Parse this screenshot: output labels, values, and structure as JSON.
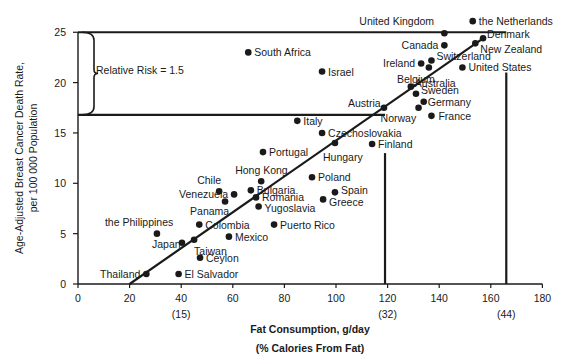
{
  "chart_data": {
    "type": "scatter",
    "title": "",
    "xlabel": "Fat Consumption, g/day",
    "xlabel_sub": "(% Calories From Fat)",
    "ylabel": "Age-Adjusted Breast Cancer Death Rate,",
    "ylabel_sub": "per 100 000 Population",
    "xlim": [
      0,
      180
    ],
    "ylim": [
      0,
      25
    ],
    "x_ticks": [
      0,
      20,
      40,
      60,
      80,
      100,
      120,
      140,
      160,
      180
    ],
    "y_ticks": [
      0,
      5,
      10,
      15,
      20,
      25
    ],
    "x_tick_annotations": [
      {
        "x": 40,
        "label": "(15)"
      },
      {
        "x": 120,
        "label": "(32)"
      },
      {
        "x": 166,
        "label": "(44)"
      }
    ],
    "grid": false,
    "legend": null,
    "annotation": {
      "label": "Relative Risk = 1.5",
      "upper_y": 25,
      "lower_y": 16.8,
      "brace_range": [
        16.8,
        25
      ]
    },
    "reference_lines": [
      {
        "type": "hline",
        "y": 25,
        "x_from": 0,
        "x_to": 166
      },
      {
        "type": "hline",
        "y": 16.8,
        "x_from": 0,
        "x_to": 119
      },
      {
        "type": "vline",
        "x": 119,
        "y_from": 0,
        "y_to": 13
      },
      {
        "type": "vline",
        "x": 166,
        "y_from": 0,
        "y_to": 21
      }
    ],
    "regression_line": {
      "x0": 20,
      "y0": 0,
      "x1": 157,
      "y1": 24.4
    },
    "points": [
      {
        "name": "Thailand",
        "x": 26.5,
        "y": 1.0,
        "lx": -48,
        "ly": 0
      },
      {
        "name": "El Salvador",
        "x": 39,
        "y": 1.0,
        "lx": 6,
        "ly": 0
      },
      {
        "name": "Ceylon",
        "x": 47.3,
        "y": 2.6,
        "lx": 6,
        "ly": 0
      },
      {
        "name": "the Philippines",
        "x": 30.6,
        "y": 5.0,
        "lx": -52,
        "ly": -12
      },
      {
        "name": "Japan",
        "x": 40.3,
        "y": 4.1,
        "lx": -30,
        "ly": 1
      },
      {
        "name": "Taiwan",
        "x": 45,
        "y": 4.4,
        "lx": 0,
        "ly": 11
      },
      {
        "name": "Colombia",
        "x": 47,
        "y": 5.9,
        "lx": 6,
        "ly": 0
      },
      {
        "name": "Mexico",
        "x": 58.5,
        "y": 4.7,
        "lx": 6,
        "ly": 0
      },
      {
        "name": "Puerto Rico",
        "x": 76,
        "y": 5.9,
        "lx": 6,
        "ly": 0
      },
      {
        "name": "Panama",
        "x": 57,
        "y": 8.2,
        "lx": -35,
        "ly": 10
      },
      {
        "name": "Venezuela",
        "x": 60.5,
        "y": 8.9,
        "lx": -68,
        "ly": 0
      },
      {
        "name": "Chile",
        "x": 54.7,
        "y": 9.2,
        "lx": -22,
        "ly": -11
      },
      {
        "name": "Bulgaria",
        "x": 67,
        "y": 9.3,
        "lx": 6,
        "ly": 0
      },
      {
        "name": "Romania",
        "x": 69,
        "y": 8.6,
        "lx": 6,
        "ly": 0
      },
      {
        "name": "Yugoslavia",
        "x": 70,
        "y": 7.7,
        "lx": 6,
        "ly": 2
      },
      {
        "name": "Hong Kong",
        "x": 71,
        "y": 10.2,
        "lx": -26,
        "ly": -11
      },
      {
        "name": "Portugal",
        "x": 71.7,
        "y": 13.1,
        "lx": 6,
        "ly": 0
      },
      {
        "name": "Poland",
        "x": 90.7,
        "y": 10.6,
        "lx": 6,
        "ly": 0
      },
      {
        "name": "Spain",
        "x": 99.6,
        "y": 9.1,
        "lx": 6,
        "ly": -2
      },
      {
        "name": "Greece",
        "x": 95,
        "y": 8.4,
        "lx": 6,
        "ly": 3
      },
      {
        "name": "Italy",
        "x": 85,
        "y": 16.2,
        "lx": 6,
        "ly": 0
      },
      {
        "name": "Czechoslovakia",
        "x": 94.6,
        "y": 15.0,
        "lx": 6,
        "ly": 0
      },
      {
        "name": "Hungary",
        "x": 99.6,
        "y": 14.0,
        "lx": -12,
        "ly": 14
      },
      {
        "name": "Finland",
        "x": 114,
        "y": 13.9,
        "lx": 6,
        "ly": 0
      },
      {
        "name": "Austria",
        "x": 118.6,
        "y": 17.5,
        "lx": -36,
        "ly": -5
      },
      {
        "name": "Israel",
        "x": 94.6,
        "y": 21.1,
        "lx": 6,
        "ly": 0
      },
      {
        "name": "South Africa",
        "x": 66,
        "y": 23.0,
        "lx": 6,
        "ly": 0
      },
      {
        "name": "Norway",
        "x": 132,
        "y": 17.5,
        "lx": -38,
        "ly": 10
      },
      {
        "name": "France",
        "x": 137,
        "y": 16.7,
        "lx": 7,
        "ly": 0
      },
      {
        "name": "Germany",
        "x": 134,
        "y": 18.1,
        "lx": 4,
        "ly": 0
      },
      {
        "name": "Sweden",
        "x": 131,
        "y": 18.9,
        "lx": 5,
        "ly": -4
      },
      {
        "name": "Australia",
        "x": 129,
        "y": 19.6,
        "lx": 4,
        "ly": -4
      },
      {
        "name": "Belgium",
        "x": 136,
        "y": 21.5,
        "lx": -32,
        "ly": 12
      },
      {
        "name": "Ireland",
        "x": 133,
        "y": 21.9,
        "lx": -36,
        "ly": 0
      },
      {
        "name": "Switzerland",
        "x": 137,
        "y": 22.2,
        "lx": 5,
        "ly": -4
      },
      {
        "name": "United States",
        "x": 149,
        "y": 21.5,
        "lx": 6,
        "ly": 0
      },
      {
        "name": "Canada",
        "x": 142,
        "y": 23.7,
        "lx": -40,
        "ly": 0
      },
      {
        "name": "United Kingdom",
        "x": 142,
        "y": 24.9,
        "lx": -85,
        "ly": -12
      },
      {
        "name": "New Zealand",
        "x": 154,
        "y": 23.9,
        "lx": 5,
        "ly": 6
      },
      {
        "name": "Denmark",
        "x": 157,
        "y": 24.4,
        "lx": 4,
        "ly": -4
      },
      {
        "name": "the Netherlands",
        "x": 153,
        "y": 26.1,
        "lx": 6,
        "ly": 0
      }
    ]
  }
}
